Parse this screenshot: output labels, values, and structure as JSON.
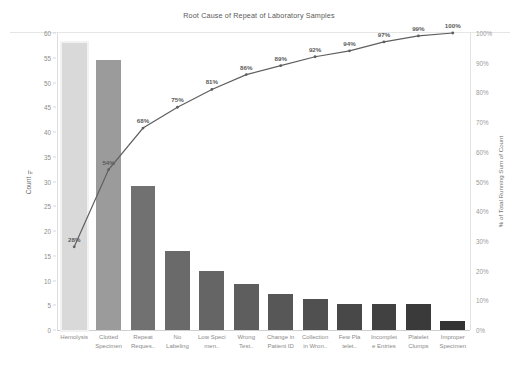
{
  "chart": {
    "title": "Root Cause of Repeat of Laboratory Samples",
    "left_axis": {
      "label": "Count",
      "sort_icon": "sort-descending-icon",
      "ticks": [
        "0",
        "5",
        "10",
        "15",
        "20",
        "25",
        "30",
        "35",
        "40",
        "45",
        "50",
        "55",
        "60"
      ],
      "min": 0,
      "max": 60
    },
    "right_axis": {
      "label": "% of Total Running Sum of Count",
      "ticks": [
        "0%",
        "10%",
        "20%",
        "30%",
        "40%",
        "50%",
        "60%",
        "70%",
        "80%",
        "90%",
        "100%"
      ],
      "min": 0,
      "max": 100
    }
  },
  "chart_data": {
    "type": "bar",
    "title": "Root Cause of Repeat of Laboratory Samples",
    "xlabel": "",
    "ylabel": "Count",
    "ylim": [
      0,
      60
    ],
    "y2label": "% of Total Running Sum of Count",
    "y2lim": [
      0,
      100
    ],
    "grid": false,
    "legend": "none",
    "categories": [
      "Hemolysis",
      "Clotted Specimen",
      "Repeat Reques..",
      "No Labeling",
      "Low Speci men..",
      "Wrong Test..",
      "Change in Patient ID",
      "Collection in Wron..",
      "Few Pla telet..",
      "Incomplet e Entries",
      "Platelet Clumps",
      "Improper Specimen"
    ],
    "category_lines": [
      [
        "Hemolysis"
      ],
      [
        "Clotted",
        "Specimen"
      ],
      [
        "Repeat",
        "Reques.."
      ],
      [
        "No",
        "Labeling"
      ],
      [
        "Low Speci",
        "men.."
      ],
      [
        "Wrong",
        "Test.."
      ],
      [
        "Change in",
        "Patient ID"
      ],
      [
        "Collection",
        "in Wron.."
      ],
      [
        "Few Pla",
        "telet.."
      ],
      [
        "Incomplet",
        "e Entries"
      ],
      [
        "Platelet",
        "Clumps"
      ],
      [
        "Improper",
        "Specimen"
      ]
    ],
    "series": [
      {
        "name": "Count",
        "type": "bar",
        "values": [
          58,
          54.5,
          29,
          16,
          12,
          9.3,
          7.2,
          6.3,
          5.2,
          5.2,
          5.2,
          1.8
        ]
      },
      {
        "name": "% of Total Running Sum of Count",
        "type": "line",
        "axis": "right",
        "values": [
          28,
          54,
          68,
          75,
          81,
          86,
          89,
          92,
          94,
          97,
          99,
          100
        ],
        "labels": [
          "28%",
          "54%",
          "68%",
          "75%",
          "81%",
          "86%",
          "89%",
          "92%",
          "94%",
          "97%",
          "99%",
          "100%"
        ]
      }
    ],
    "bar_colors": [
      "#d9d9d9",
      "#9b9b9b",
      "#717171",
      "#6a6a6a",
      "#656565",
      "#5e5e5e",
      "#575757",
      "#505050",
      "#484848",
      "#414141",
      "#3a3a3a",
      "#333333"
    ],
    "highlighted_category": "Hemolysis",
    "line_color": "#5f5f5f"
  }
}
